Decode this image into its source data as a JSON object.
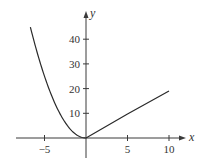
{
  "chart_data": {
    "type": "line",
    "title": "",
    "xlabel": "x",
    "ylabel": "y",
    "xlim": [
      -8,
      12
    ],
    "ylim": [
      -8,
      50
    ],
    "grid": false,
    "legend": null,
    "x_ticks": [
      -5,
      5,
      10
    ],
    "x_tick_labels": [
      "−5",
      "5",
      "10"
    ],
    "y_ticks": [
      10,
      20,
      30,
      40
    ],
    "y_tick_labels": [
      "10",
      "20",
      "30",
      "40"
    ],
    "series": [
      {
        "name": "left branch (parabola, y = x^2)",
        "x": [
          -6.7,
          -6,
          -5,
          -4,
          -3,
          -2,
          -1,
          0
        ],
        "values": [
          44.9,
          36,
          25,
          16,
          9,
          4,
          1,
          0
        ]
      },
      {
        "name": "right branch (line, y ≈ 2x)",
        "x": [
          0,
          5,
          10
        ],
        "values": [
          0,
          9.7,
          19
        ]
      }
    ]
  },
  "axes": {
    "x_label": "x",
    "y_label": "y"
  }
}
